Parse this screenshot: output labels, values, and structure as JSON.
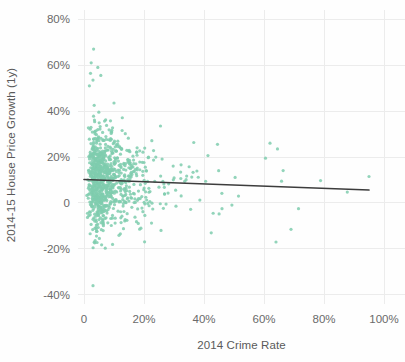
{
  "chart_data": {
    "type": "scatter",
    "title": "",
    "xlabel": "2014 Crime Rate",
    "ylabel": "2014-15 House Price Growth (1y)",
    "xlim": [
      -2,
      107
    ],
    "ylim": [
      -44,
      84
    ],
    "xticks": [
      0,
      20,
      40,
      60,
      80,
      100
    ],
    "xtick_labels": [
      "0",
      "20%",
      "40%",
      "60%",
      "80%",
      "100%"
    ],
    "yticks": [
      -40,
      -20,
      0,
      20,
      40,
      60,
      80
    ],
    "ytick_labels": [
      "-40%",
      "-20%",
      "0",
      "20%",
      "40%",
      "60%",
      "80%"
    ],
    "grid": true,
    "grid_color": "#ececec",
    "legend": null,
    "point_color": "#7fccae",
    "point_opacity": 0.85,
    "point_radius": 1.6,
    "n_points": 920,
    "series": [
      {
        "name": "Local authority districts",
        "marker": "circle",
        "color": "#7fccae",
        "x_summary": {
          "min": 0.3,
          "max": 95.0,
          "median": 7.0,
          "q1": 4.0,
          "q3": 12.0
        },
        "y_summary": {
          "min": -36.0,
          "max": 67.0,
          "median": 9.0,
          "q1": 2.0,
          "q3": 17.0
        }
      }
    ],
    "trendline": {
      "type": "linear-fit",
      "color": "#3c3c3c",
      "x_start": 0.0,
      "x_end": 95.0,
      "y_start": 10.2,
      "y_end": 5.6,
      "slope_per_unit_x": -0.0484,
      "intercept": 10.2,
      "direction": "slightly-negative"
    },
    "notable_points": [
      {
        "x": 3.2,
        "y": 67.0,
        "note": "highest growth outlier"
      },
      {
        "x": 2.4,
        "y": 61.0
      },
      {
        "x": 4.6,
        "y": 59.0
      },
      {
        "x": 5.6,
        "y": 55.5
      },
      {
        "x": 3.0,
        "y": 53.5
      },
      {
        "x": 1.8,
        "y": 51.0
      },
      {
        "x": 3.4,
        "y": 42.5
      },
      {
        "x": 10.0,
        "y": 43.5
      },
      {
        "x": 25.5,
        "y": 33.5
      },
      {
        "x": 44.5,
        "y": 25.5
      },
      {
        "x": 62.0,
        "y": 26.0
      },
      {
        "x": 64.5,
        "y": 23.5
      },
      {
        "x": 60.5,
        "y": 19.5
      },
      {
        "x": 95.0,
        "y": 11.5,
        "note": "highest crime rate outlier"
      },
      {
        "x": 51.5,
        "y": 3.0
      },
      {
        "x": 46.0,
        "y": -2.5
      },
      {
        "x": 71.5,
        "y": -2.5
      },
      {
        "x": 69.0,
        "y": -11.5
      },
      {
        "x": 64.0,
        "y": -17.0
      },
      {
        "x": 3.0,
        "y": -36.0,
        "note": "lowest growth outlier"
      }
    ]
  },
  "axes": {
    "x_title": "2014 Crime Rate",
    "y_title": "2014-15 House Price Growth (1y)",
    "x_tick_labels": [
      "0",
      "20%",
      "40%",
      "60%",
      "80%",
      "100%"
    ],
    "y_tick_labels": [
      "80%",
      "60%",
      "40%",
      "20%",
      "0",
      "-20%",
      "-40%"
    ]
  },
  "colors": {
    "point": "#7fccae",
    "trendline": "#3c3c3c",
    "grid": "#ececec",
    "text": "#6a6a6a",
    "background": "#fefefe"
  }
}
